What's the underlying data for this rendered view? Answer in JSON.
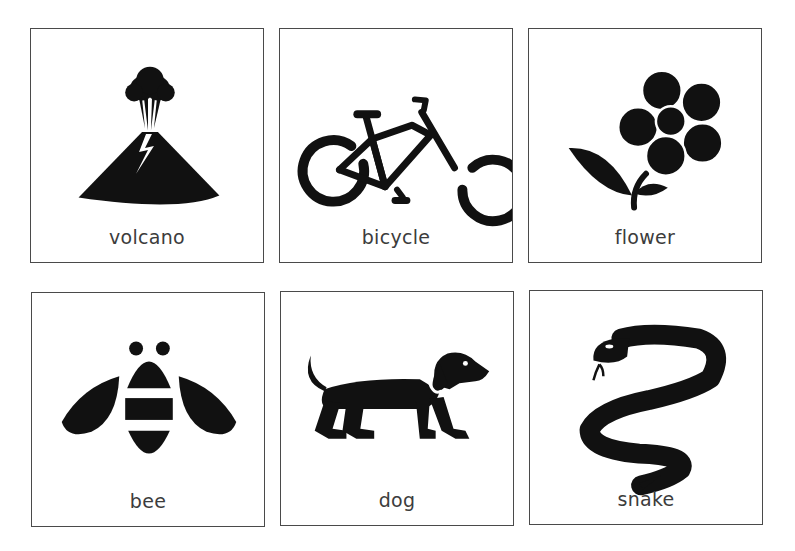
{
  "cards": [
    {
      "label": "volcano",
      "icon": "volcano-icon"
    },
    {
      "label": "bicycle",
      "icon": "bicycle-icon"
    },
    {
      "label": "flower",
      "icon": "flower-icon"
    },
    {
      "label": "bee",
      "icon": "bee-icon"
    },
    {
      "label": "dog",
      "icon": "dog-icon"
    },
    {
      "label": "snake",
      "icon": "snake-icon"
    }
  ],
  "colors": {
    "icon": "#111111",
    "border": "#4a4a4a",
    "label": "#3c3c3c",
    "background": "#ffffff"
  }
}
